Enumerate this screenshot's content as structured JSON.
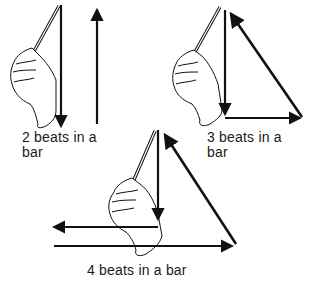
{
  "figure": {
    "panels": [
      {
        "id": "two-beats",
        "label_line1": "2 beats in a",
        "label_line2": "bar",
        "beats": 2
      },
      {
        "id": "three-beats",
        "label_line1": "3 beats in a",
        "label_line2": "bar",
        "beats": 3
      },
      {
        "id": "four-beats",
        "label_line1": "4 beats in a bar",
        "beats": 4
      }
    ],
    "colors": {
      "ink": "#111111",
      "background": "#ffffff"
    }
  }
}
